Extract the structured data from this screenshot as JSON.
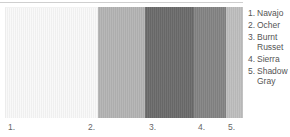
{
  "palette": {
    "swatches": [
      {
        "index": "1.",
        "name": "Navajo",
        "color": "#f9f9f9",
        "width": 93,
        "label_x": 8
      },
      {
        "index": "2.",
        "name": "Ocher",
        "color": "#b4b4b4",
        "width": 47,
        "label_x": 88
      },
      {
        "index": "3.",
        "name": "Burnt Russet",
        "color": "#6b6b6b",
        "width": 49,
        "label_x": 149
      },
      {
        "index": "4.",
        "name": "Sierra",
        "color": "#848484",
        "width": 32,
        "label_x": 198
      },
      {
        "index": "5.",
        "name": "Shadow Gray",
        "color": "#bebebe",
        "width": 17,
        "label_x": 228
      }
    ]
  },
  "legend": {
    "items": [
      {
        "num": "1.",
        "text": "Navajo"
      },
      {
        "num": "2.",
        "text": "Ocher"
      },
      {
        "num": "3.",
        "text": "Burnt Russet"
      },
      {
        "num": "4.",
        "text": "Sierra"
      },
      {
        "num": "5.",
        "text": "Shadow Gray"
      }
    ]
  },
  "labels": {
    "bottom": [
      "1.",
      "2.",
      "3.",
      "4.",
      "5."
    ]
  }
}
